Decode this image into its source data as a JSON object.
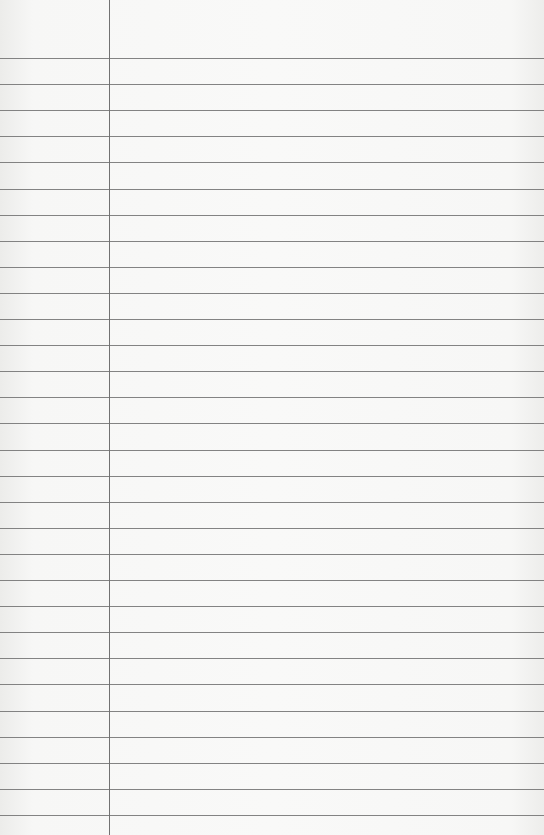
{
  "paper": {
    "type": "lined-paper",
    "background_color": "#f7f7f6",
    "line_color": "#6e6e6e",
    "margin_line_x": 109,
    "first_line_y": 58,
    "line_spacing": 26.1,
    "line_count": 30
  }
}
